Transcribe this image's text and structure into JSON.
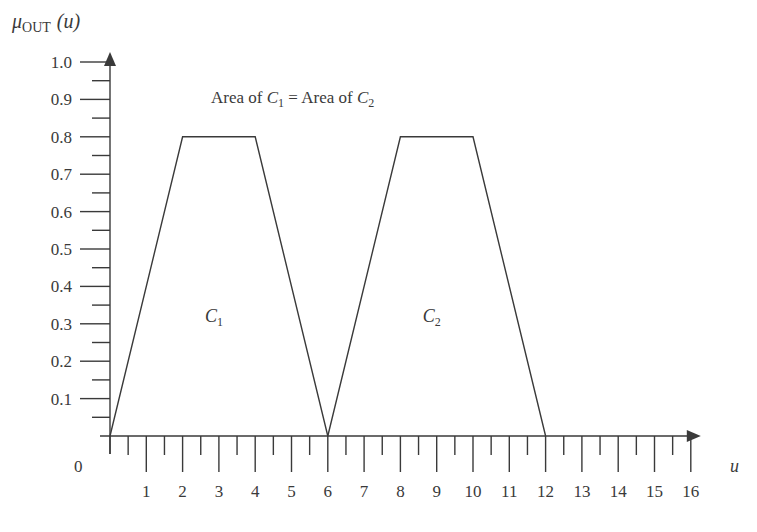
{
  "chart_data": {
    "type": "line",
    "title": "",
    "annotation": "Area of C1 = Area of C2",
    "annotation_parts": {
      "pre": "Area of ",
      "c1_sym": "C",
      "c1_sub": "1",
      "mid": " = Area of ",
      "c2_sym": "C",
      "c2_sub": "2"
    },
    "ylabel": {
      "symbol": "μ",
      "subscript": "OUT",
      "arg": "(u)"
    },
    "xlabel": "u",
    "origin_label": "0",
    "xlim": [
      0,
      16
    ],
    "ylim": [
      0,
      1.0
    ],
    "x_ticks": [
      "1",
      "2",
      "3",
      "4",
      "5",
      "6",
      "7",
      "8",
      "9",
      "10",
      "11",
      "12",
      "13",
      "14",
      "15",
      "16"
    ],
    "x_minor_step": 0.5,
    "y_ticks": [
      "0.1",
      "0.2",
      "0.3",
      "0.4",
      "0.5",
      "0.6",
      "0.7",
      "0.8",
      "0.9",
      "1.0"
    ],
    "y_minor_step": 0.05,
    "grid": false,
    "series": [
      {
        "name": "C1",
        "label_sym": "C",
        "label_sub": "1",
        "x": [
          0,
          2,
          4,
          6
        ],
        "y": [
          0,
          0.8,
          0.8,
          0
        ],
        "label_pos": [
          3,
          0.32
        ]
      },
      {
        "name": "C2",
        "label_sym": "C",
        "label_sub": "2",
        "x": [
          6,
          8,
          10,
          12
        ],
        "y": [
          0,
          0.8,
          0.8,
          0
        ],
        "label_pos": [
          9,
          0.32
        ]
      }
    ]
  }
}
